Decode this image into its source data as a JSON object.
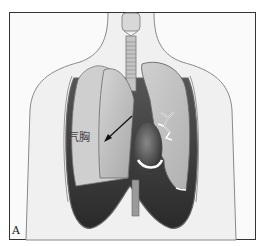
{
  "figure": {
    "panel_label": "A",
    "annotation_label": "气胸",
    "colors": {
      "frame": "#333333",
      "background": "#fafafa",
      "body_outline": "#777777",
      "lung_fill": "#c8c8c8",
      "pleural_cavity_dark": "#3a3a3a",
      "heart": "#555555"
    }
  }
}
